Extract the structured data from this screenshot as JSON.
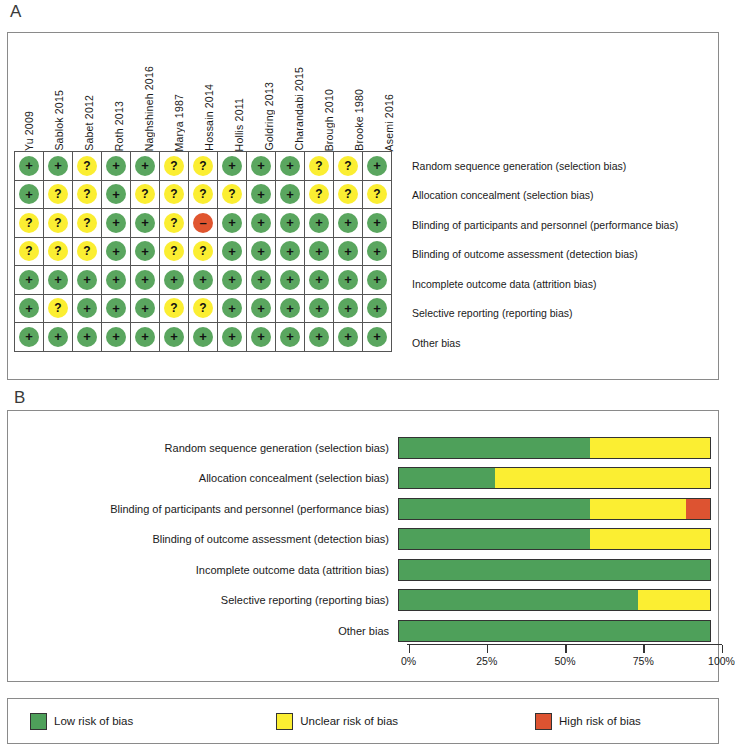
{
  "panels": {
    "a_letter": "A",
    "b_letter": "B"
  },
  "studies": [
    "Yu 2009",
    "Sablok 2015",
    "Sabet 2012",
    "Roth 2013",
    "Naghshineh 2016",
    "Marya 1987",
    "Hossain 2014",
    "Hollis 2011",
    "Goldring 2013",
    "Charandabi 2015",
    "Brough 2010",
    "Brooke 1980",
    "Asemi 2016"
  ],
  "domains": [
    "Random sequence generation (selection bias)",
    "Allocation concealment (selection bias)",
    "Blinding of participants and personnel (performance bias)",
    "Blinding of outcome assessment (detection bias)",
    "Incomplete outcome data (attrition bias)",
    "Selective reporting (reporting bias)",
    "Other bias"
  ],
  "colors": {
    "low": "#4ea05a",
    "unclear": "#fbee32",
    "high": "#dd5331"
  },
  "legend": {
    "items": [
      {
        "key": "low",
        "label": "Low risk of bias"
      },
      {
        "key": "unclear",
        "label": "Unclear risk of bias"
      },
      {
        "key": "high",
        "label": "High risk of bias"
      }
    ]
  },
  "axis": {
    "ticks": [
      0,
      25,
      50,
      75,
      100
    ],
    "tick_labels": [
      "0%",
      "25%",
      "50%",
      "75%",
      "100%"
    ],
    "min": 0,
    "max": 100
  },
  "chart_data": {
    "type": "heatmap",
    "xlabel": "",
    "ylabel": "",
    "categories": [
      "Yu 2009",
      "Sablok 2015",
      "Sabet 2012",
      "Roth 2013",
      "Naghshineh 2016",
      "Marya 1987",
      "Hossain 2014",
      "Hollis 2011",
      "Goldring 2013",
      "Charandabi 2015",
      "Brough 2010",
      "Brooke 1980",
      "Asemi 2016"
    ],
    "rows": [
      {
        "domain": "Random sequence generation (selection bias)",
        "judgements": [
          "low",
          "low",
          "unclear",
          "low",
          "low",
          "unclear",
          "unclear",
          "low",
          "low",
          "low",
          "unclear",
          "unclear",
          "low"
        ]
      },
      {
        "domain": "Allocation concealment (selection bias)",
        "judgements": [
          "low",
          "unclear",
          "unclear",
          "low",
          "unclear",
          "unclear",
          "unclear",
          "unclear",
          "low",
          "low",
          "unclear",
          "unclear",
          "unclear"
        ]
      },
      {
        "domain": "Blinding of participants and personnel (performance bias)",
        "judgements": [
          "unclear",
          "unclear",
          "unclear",
          "low",
          "low",
          "unclear",
          "high",
          "low",
          "low",
          "low",
          "low",
          "low",
          "low"
        ]
      },
      {
        "domain": "Blinding of outcome assessment (detection bias)",
        "judgements": [
          "unclear",
          "unclear",
          "unclear",
          "low",
          "low",
          "unclear",
          "unclear",
          "low",
          "low",
          "low",
          "low",
          "low",
          "low"
        ]
      },
      {
        "domain": "Incomplete outcome data (attrition bias)",
        "judgements": [
          "low",
          "low",
          "low",
          "low",
          "low",
          "low",
          "low",
          "low",
          "low",
          "low",
          "low",
          "low",
          "low"
        ]
      },
      {
        "domain": "Selective reporting (reporting bias)",
        "judgements": [
          "low",
          "unclear",
          "low",
          "low",
          "low",
          "unclear",
          "unclear",
          "low",
          "low",
          "low",
          "low",
          "low",
          "low"
        ]
      },
      {
        "domain": "Other bias",
        "judgements": [
          "low",
          "low",
          "low",
          "low",
          "low",
          "low",
          "low",
          "low",
          "low",
          "low",
          "low",
          "low",
          "low"
        ]
      }
    ],
    "graph": {
      "type": "bar",
      "orientation": "horizontal",
      "stacked": true,
      "xlabel": "",
      "ylabel": "",
      "xlim": [
        0,
        100
      ],
      "tick_labels": [
        "0%",
        "25%",
        "50%",
        "75%",
        "100%"
      ],
      "legend_position": "bottom",
      "grid": false,
      "categories": [
        "Random sequence generation (selection bias)",
        "Allocation concealment (selection bias)",
        "Blinding of participants and personnel (performance bias)",
        "Blinding of outcome assessment (detection bias)",
        "Incomplete outcome data (attrition bias)",
        "Selective reporting (reporting bias)",
        "Other bias"
      ],
      "series": [
        {
          "name": "Low risk of bias",
          "key": "low",
          "values": [
            61.5,
            30.8,
            61.5,
            61.5,
            100.0,
            76.9,
            100.0
          ]
        },
        {
          "name": "Unclear risk of bias",
          "key": "unclear",
          "values": [
            38.5,
            69.2,
            30.8,
            38.5,
            0.0,
            23.1,
            0.0
          ]
        },
        {
          "name": "High risk of bias",
          "key": "high",
          "values": [
            0.0,
            0.0,
            7.7,
            0.0,
            0.0,
            0.0,
            0.0
          ]
        }
      ]
    }
  }
}
